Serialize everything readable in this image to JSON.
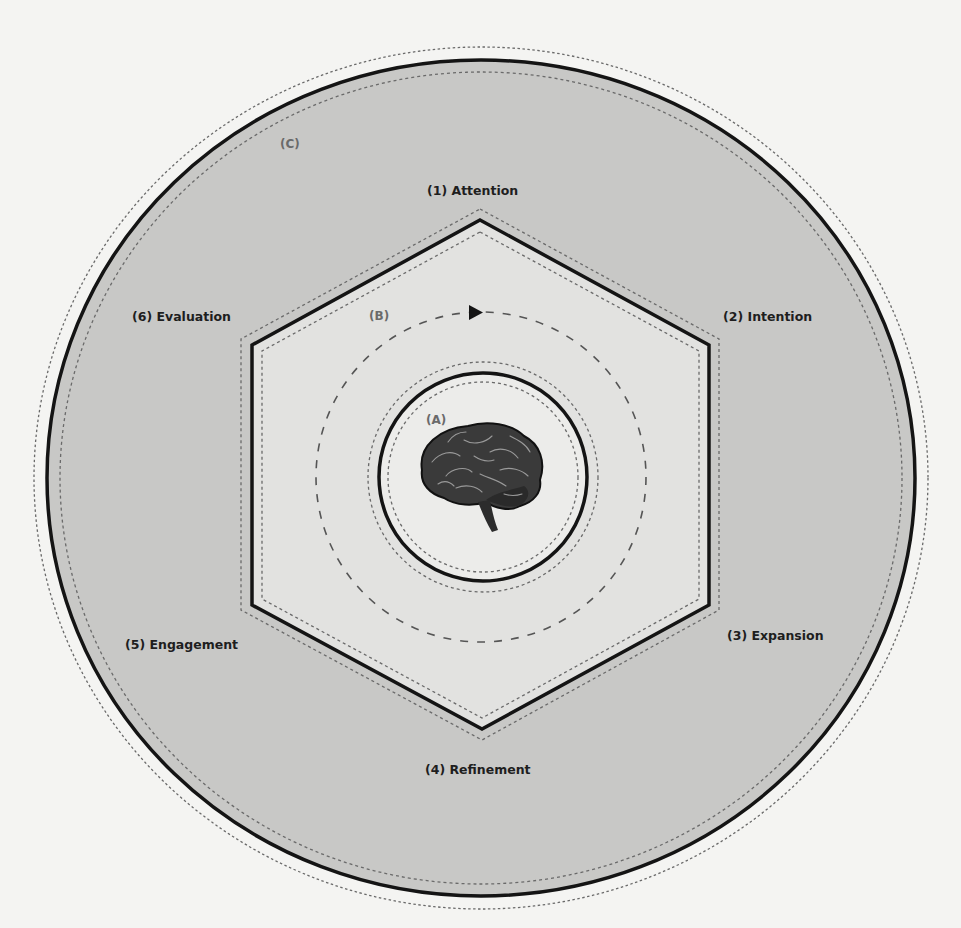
{
  "diagram": {
    "regions": {
      "inner": "(A)",
      "middle": "(B)",
      "outer": "(C)"
    },
    "stages": [
      {
        "label": "(1) Attention"
      },
      {
        "label": "(2) Intention"
      },
      {
        "label": "(3) Expansion"
      },
      {
        "label": "(4) Refinement"
      },
      {
        "label": "(5) Engagement"
      },
      {
        "label": "(6) Evaluation"
      }
    ],
    "center_icon": "brain-icon",
    "cycle_direction": "clockwise-arrow",
    "colors": {
      "page_background": "#f4f4f2",
      "outer_ring_fill": "#c8c8c6",
      "hexagon_fill": "#e2e2e0",
      "inner_circle_fill": "#ececea",
      "stroke": "#141414",
      "dotted_stroke": "#6a6a6a",
      "label_text": "#1e1e1e",
      "region_label_text": "#6a6a6a"
    }
  }
}
